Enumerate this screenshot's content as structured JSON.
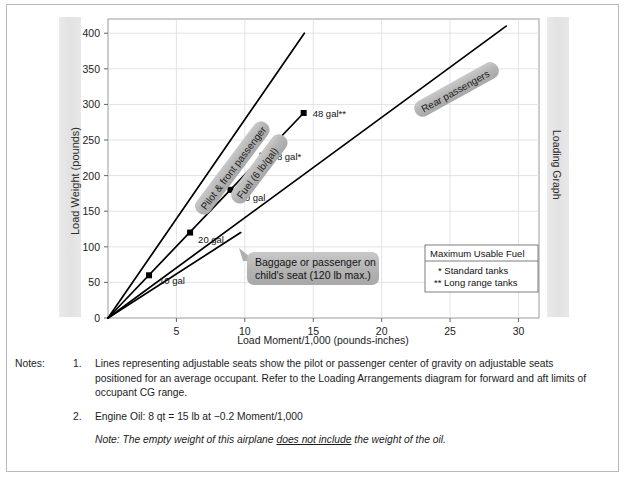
{
  "page": {
    "side_label_right": "Loading Graph"
  },
  "chart_data": {
    "type": "line",
    "title": "",
    "xlabel": "Load Moment/1,000 (pounds-inches)",
    "ylabel": "Load Weight (pounds)",
    "xlim": [
      0,
      31.5
    ],
    "ylim": [
      0,
      420
    ],
    "xticks": [
      0,
      5,
      10,
      15,
      20,
      25,
      30
    ],
    "yticks": [
      0,
      50,
      100,
      150,
      200,
      250,
      300,
      350,
      400
    ],
    "grid": true,
    "legend_position": "inside-right",
    "series": [
      {
        "name": "Pilot & front passenger",
        "label": "Pilot & front passenger",
        "x": [
          0,
          14.35
        ],
        "y": [
          0,
          400
        ],
        "markers": []
      },
      {
        "name": "Fuel (6 lb/gal)",
        "label": "Fuel (6 lb/gal)",
        "x": [
          0,
          14.3
        ],
        "y": [
          0,
          288
        ],
        "markers": [
          {
            "label": "10 gal",
            "x": 3.0,
            "y": 60
          },
          {
            "label": "20 gal",
            "x": 6.0,
            "y": 120
          },
          {
            "label": "30 gal",
            "x": 8.95,
            "y": 180
          },
          {
            "label": "38 gal*",
            "x": 11.3,
            "y": 228
          },
          {
            "label": "48 gal**",
            "x": 14.3,
            "y": 288
          }
        ]
      },
      {
        "name": "Rear passengers",
        "label": "Rear passengers",
        "x": [
          0,
          29.1
        ],
        "y": [
          0,
          410
        ],
        "markers": []
      },
      {
        "name": "Baggage or passenger on child's seat",
        "label": "Baggage or passenger on child's seat (120 lb max.)",
        "x": [
          0,
          9.7
        ],
        "y": [
          0,
          120
        ],
        "markers": []
      }
    ],
    "annotations": [
      {
        "name": "baggage-callout",
        "line1": "Baggage or passenger on",
        "line2": "child's seat (120 lb max.)"
      }
    ],
    "legend": {
      "title": "Maximum Usable Fuel",
      "entries": [
        "*  Standard tanks",
        "**  Long range tanks"
      ]
    }
  },
  "notes": {
    "label": "Notes:",
    "items": [
      {
        "number": "1.",
        "text": "Lines representing adjustable seats show the pilot or passenger center of gravity on adjustable seats positioned for an average occupant. Refer to the Loading Arrangements diagram for forward and aft limits of occupant CG range."
      },
      {
        "number": "2.",
        "text": "Engine Oil: 8 qt = 15 lb at −0.2 Moment/1,000"
      }
    ],
    "final_note": {
      "prefix": "Note: The empty weight of this airplane ",
      "underlined": "does not include",
      "suffix": " the weight of the oil."
    }
  }
}
